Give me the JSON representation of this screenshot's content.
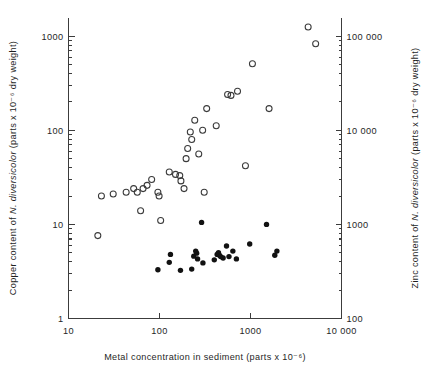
{
  "chart_data": {
    "type": "scatter",
    "title": "",
    "xlabel": "Metal concentration in sediment (parts x 10⁻⁶)",
    "ylabel_left": "Copper content of N. diversicolor (parts x 10⁻⁶ dry weight)",
    "ylabel_right": "Zinc content of N. diversicolor (parts x 10⁻⁶ dry weight)",
    "xscale": "log",
    "yscale": "log",
    "xlim": [
      10,
      10000
    ],
    "ylim_left": [
      1,
      2000
    ],
    "ylim_right": [
      100,
      200000
    ],
    "grid": false,
    "legend": "none",
    "x_ticks": [
      "10",
      "100",
      "1000",
      "10 000"
    ],
    "x_tick_values": [
      10,
      100,
      1000,
      10000
    ],
    "y_ticks_left": [
      "1000",
      "100",
      "10",
      "1"
    ],
    "y_tick_values_left": [
      1000,
      100,
      10,
      1
    ],
    "y_ticks_right": [
      "100 000",
      "10 000",
      "1000",
      "100"
    ],
    "y_tick_values_right": [
      100000,
      10000,
      1000,
      100
    ],
    "axis_label_left_parts": {
      "prefix": "Copper content of ",
      "italic": "N. diversicolor",
      "suffix": " (parts x 10⁻⁶ dry weight)"
    },
    "axis_label_right_parts": {
      "prefix": "Zinc content of ",
      "italic": "N. diversicolor",
      "suffix": " (parts x 10⁻⁶ dry weight)"
    },
    "axis_label_bottom_parts": {
      "prefix": "Metal concentration in sediment (parts x 10⁻⁶)"
    },
    "series": [
      {
        "name": "Copper",
        "marker": "open-circle",
        "axis": "left",
        "color": "#3a3a3a",
        "points": [
          {
            "x": 21,
            "y": 7.6
          },
          {
            "x": 23,
            "y": 20
          },
          {
            "x": 31,
            "y": 21
          },
          {
            "x": 43,
            "y": 22
          },
          {
            "x": 52,
            "y": 24
          },
          {
            "x": 57,
            "y": 22
          },
          {
            "x": 62,
            "y": 14
          },
          {
            "x": 66,
            "y": 24
          },
          {
            "x": 73,
            "y": 26
          },
          {
            "x": 82,
            "y": 30
          },
          {
            "x": 96,
            "y": 22
          },
          {
            "x": 99,
            "y": 20
          },
          {
            "x": 103,
            "y": 11
          },
          {
            "x": 128,
            "y": 36
          },
          {
            "x": 150,
            "y": 34
          },
          {
            "x": 167,
            "y": 33
          },
          {
            "x": 172,
            "y": 29
          },
          {
            "x": 186,
            "y": 24
          },
          {
            "x": 196,
            "y": 50
          },
          {
            "x": 204,
            "y": 64
          },
          {
            "x": 218,
            "y": 96
          },
          {
            "x": 226,
            "y": 80
          },
          {
            "x": 244,
            "y": 128
          },
          {
            "x": 270,
            "y": 56
          },
          {
            "x": 298,
            "y": 100
          },
          {
            "x": 310,
            "y": 22
          },
          {
            "x": 330,
            "y": 170
          },
          {
            "x": 420,
            "y": 112
          },
          {
            "x": 560,
            "y": 240
          },
          {
            "x": 610,
            "y": 235
          },
          {
            "x": 720,
            "y": 260
          },
          {
            "x": 880,
            "y": 42
          },
          {
            "x": 1050,
            "y": 510
          },
          {
            "x": 1600,
            "y": 170
          },
          {
            "x": 4300,
            "y": 1250
          },
          {
            "x": 5200,
            "y": 830
          }
        ]
      },
      {
        "name": "Zinc",
        "marker": "filled-circle",
        "axis": "right",
        "color": "#121212",
        "points": [
          {
            "x": 96,
            "y": 330
          },
          {
            "x": 128,
            "y": 395
          },
          {
            "x": 132,
            "y": 480
          },
          {
            "x": 170,
            "y": 325
          },
          {
            "x": 226,
            "y": 335
          },
          {
            "x": 238,
            "y": 460
          },
          {
            "x": 250,
            "y": 520
          },
          {
            "x": 256,
            "y": 495
          },
          {
            "x": 262,
            "y": 430
          },
          {
            "x": 290,
            "y": 1050
          },
          {
            "x": 300,
            "y": 390
          },
          {
            "x": 400,
            "y": 420
          },
          {
            "x": 430,
            "y": 480
          },
          {
            "x": 445,
            "y": 500
          },
          {
            "x": 455,
            "y": 470
          },
          {
            "x": 470,
            "y": 455
          },
          {
            "x": 500,
            "y": 440
          },
          {
            "x": 545,
            "y": 590
          },
          {
            "x": 580,
            "y": 455
          },
          {
            "x": 640,
            "y": 520
          },
          {
            "x": 700,
            "y": 430
          },
          {
            "x": 980,
            "y": 620
          },
          {
            "x": 1500,
            "y": 1000
          },
          {
            "x": 1850,
            "y": 470
          },
          {
            "x": 1950,
            "y": 520
          }
        ]
      }
    ]
  }
}
